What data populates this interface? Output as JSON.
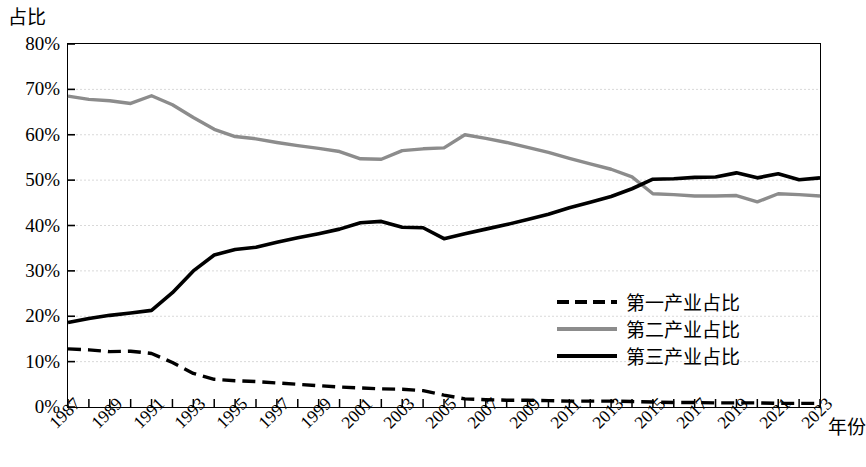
{
  "chart_data": {
    "type": "line",
    "title": "",
    "ylabel": "占比",
    "xlabel": "年份",
    "ylim": [
      0,
      80
    ],
    "y_ticks": [
      "0%",
      "10%",
      "20%",
      "30%",
      "40%",
      "50%",
      "60%",
      "70%",
      "80%"
    ],
    "y_tick_values": [
      0,
      10,
      20,
      30,
      40,
      50,
      60,
      70,
      80
    ],
    "grid": true,
    "grid_color": "#d9d9d9",
    "legend_position": "center-right-inside",
    "x": [
      1987,
      1988,
      1989,
      1990,
      1991,
      1992,
      1993,
      1994,
      1995,
      1996,
      1997,
      1998,
      1999,
      2000,
      2001,
      2002,
      2003,
      2004,
      2005,
      2006,
      2007,
      2008,
      2009,
      2010,
      2011,
      2012,
      2013,
      2014,
      2015,
      2016,
      2017,
      2018,
      2019,
      2020,
      2021,
      2022,
      2023
    ],
    "x_tick_labels": [
      "1987",
      "1989",
      "1991",
      "1993",
      "1995",
      "1997",
      "1999",
      "2001",
      "2003",
      "2005",
      "2007",
      "2009",
      "2011",
      "2013",
      "2015",
      "2017",
      "2019",
      "2021",
      "2023"
    ],
    "series": [
      {
        "name": "第一产业占比",
        "color": "#000000",
        "style": "dashed",
        "width": 3.4,
        "values": [
          12.8,
          12.6,
          12.2,
          12.3,
          11.8,
          9.8,
          7.4,
          6.1,
          5.8,
          5.6,
          5.3,
          5.0,
          4.7,
          4.4,
          4.2,
          4.0,
          3.9,
          3.6,
          2.6,
          1.8,
          1.6,
          1.5,
          1.5,
          1.4,
          1.3,
          1.3,
          1.3,
          1.2,
          1.1,
          1.0,
          1.0,
          0.9,
          0.9,
          0.9,
          0.8,
          0.8,
          0.8
        ]
      },
      {
        "name": "第二产业占比",
        "color": "#8c8c8c",
        "style": "solid",
        "width": 3.4,
        "values": [
          68.5,
          67.8,
          67.5,
          66.9,
          68.6,
          66.6,
          63.8,
          61.2,
          59.6,
          59.1,
          58.3,
          57.6,
          57.0,
          56.3,
          54.7,
          54.6,
          56.5,
          56.9,
          57.1,
          60.0,
          59.2,
          58.3,
          57.2,
          56.1,
          54.8,
          53.6,
          52.4,
          50.7,
          47.0,
          46.8,
          46.5,
          46.5,
          46.6,
          45.2,
          47.0,
          46.8,
          46.5
        ]
      },
      {
        "name": "第三产业占比",
        "color": "#000000",
        "style": "solid",
        "width": 3.6,
        "values": [
          18.6,
          19.5,
          20.2,
          20.7,
          21.3,
          25.2,
          30.0,
          33.5,
          34.7,
          35.2,
          36.3,
          37.3,
          38.2,
          39.2,
          40.6,
          40.9,
          39.6,
          39.5,
          37.1,
          38.2,
          39.2,
          40.2,
          41.3,
          42.5,
          43.9,
          45.1,
          46.4,
          48.1,
          50.2,
          50.3,
          50.6,
          50.7,
          51.6,
          50.5,
          51.4,
          50.1,
          50.5
        ]
      }
    ]
  }
}
